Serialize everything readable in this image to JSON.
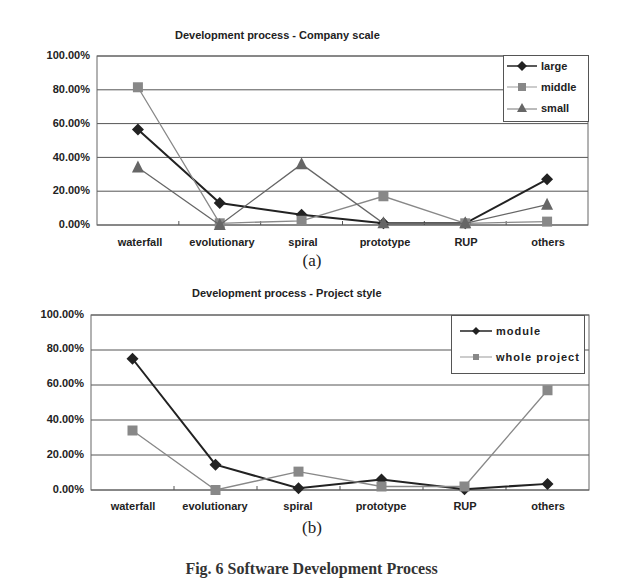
{
  "chart_data": [
    {
      "type": "line",
      "title": "Development process - Company scale",
      "xlabel": "",
      "ylabel": "",
      "categories": [
        "waterfall",
        "evolutionary",
        "spiral",
        "prototype",
        "RUP",
        "others"
      ],
      "yticks": [
        "100.00%",
        "80.00%",
        "60.00%",
        "40.00%",
        "20.00%",
        "0.00%"
      ],
      "ylim": [
        0,
        100
      ],
      "grid": true,
      "legend_position": "upper right",
      "series": [
        {
          "name": "large",
          "marker": "diamond",
          "color": "#222222",
          "values": [
            56.5,
            13,
            6,
            1,
            1,
            27
          ]
        },
        {
          "name": "middle",
          "marker": "square",
          "color": "#888888",
          "values": [
            81.5,
            1,
            2.5,
            17,
            1,
            2
          ]
        },
        {
          "name": "small",
          "marker": "triangle",
          "color": "#666666",
          "values": [
            34,
            0,
            36,
            1,
            1,
            12
          ]
        }
      ],
      "caption": "(a)"
    },
    {
      "type": "line",
      "title": "Development process - Project style",
      "xlabel": "",
      "ylabel": "",
      "categories": [
        "waterfall",
        "evolutionary",
        "spiral",
        "prototype",
        "RUP",
        "others"
      ],
      "yticks": [
        "100.00%",
        "80.00%",
        "60.00%",
        "40.00%",
        "20.00%",
        "0.00%"
      ],
      "ylim": [
        0,
        100
      ],
      "grid": true,
      "legend_position": "upper right",
      "series": [
        {
          "name": "module",
          "marker": "diamond",
          "color": "#222222",
          "values": [
            75,
            14.5,
            1,
            6,
            0.5,
            3.5
          ]
        },
        {
          "name": "whole project",
          "marker": "square",
          "color": "#888888",
          "values": [
            34,
            0,
            10.5,
            2,
            2,
            57
          ]
        }
      ],
      "caption": "(b)"
    }
  ],
  "figure_caption": "Fig. 6 Software Development Process"
}
